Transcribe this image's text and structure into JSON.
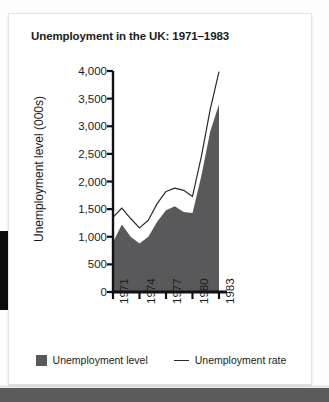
{
  "card": {
    "title": "Unemployment in the UK: 1971–1983"
  },
  "legend": {
    "items": [
      {
        "label": "Unemployment level",
        "marker": "filled-square",
        "color": "#59595b"
      },
      {
        "label": "Unemployment rate",
        "marker": "line",
        "color": "#2a2a2a"
      }
    ]
  },
  "colors": {
    "area_fill": "#59595b",
    "line": "#2a2a2a",
    "axis": "#111111",
    "card_bg": "#ffffff",
    "page_bg": "#fdfdfd",
    "bottom_band": "#5b5b5d",
    "left_bar": "#0c0c0c"
  },
  "chart_data": {
    "type": "area",
    "title": "Unemployment in the UK: 1971–1983",
    "xlabel": "",
    "ylabel": "Unemployment level (000s)",
    "xlim": [
      1971,
      1983
    ],
    "ylim": [
      0,
      4000
    ],
    "ytick_labels": [
      "4,000",
      "3,500",
      "3,000",
      "2,500",
      "2,000",
      "1,500",
      "1,000",
      "500",
      "0"
    ],
    "yticks": [
      4000,
      3500,
      3000,
      2500,
      2000,
      1500,
      1000,
      500,
      0
    ],
    "xtick_labels": [
      "1971",
      "1974",
      "1977",
      "1980",
      "1983"
    ],
    "xticks": [
      1971,
      1974,
      1977,
      1980,
      1983
    ],
    "grid": false,
    "legend_position": "bottom",
    "x": [
      1971,
      1972,
      1973,
      1974,
      1975,
      1976,
      1977,
      1978,
      1979,
      1980,
      1981,
      1982,
      1983
    ],
    "series": [
      {
        "name": "Unemployment level",
        "type": "area",
        "color": "#59595b",
        "values": [
          900,
          1220,
          1000,
          880,
          1000,
          1270,
          1480,
          1550,
          1450,
          1430,
          2100,
          2900,
          3400
        ]
      },
      {
        "name": "Unemployment rate",
        "type": "line",
        "color": "#2a2a2a",
        "values": [
          1350,
          1520,
          1330,
          1160,
          1300,
          1600,
          1820,
          1880,
          1840,
          1730,
          2450,
          3300,
          3990
        ]
      }
    ]
  }
}
